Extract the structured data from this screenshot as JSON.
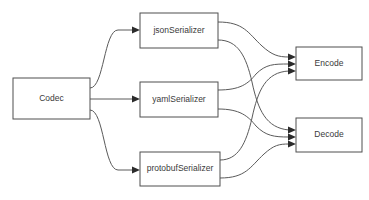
{
  "diagram": {
    "background_color": "#ffffff",
    "node_border_color": "#4f4f4f",
    "node_fill_color": "#ffffff",
    "edge_color": "#5a5a5a",
    "arrow_color": "#2b2b2b",
    "text_color": "#3a3a3a",
    "nodes": [
      {
        "id": "codec",
        "label": "Codec",
        "x": 13,
        "y": 78,
        "w": 77,
        "h": 41
      },
      {
        "id": "json",
        "label": "jsonSerializer",
        "x": 140,
        "y": 13,
        "w": 78,
        "h": 35
      },
      {
        "id": "yaml",
        "label": "yamlSerializer",
        "x": 140,
        "y": 82,
        "w": 78,
        "h": 35
      },
      {
        "id": "protobuf",
        "label": "protobufSerializer",
        "x": 140,
        "y": 152,
        "w": 80,
        "h": 34
      },
      {
        "id": "encode",
        "label": "Encode",
        "x": 296,
        "y": 47,
        "w": 66,
        "h": 33
      },
      {
        "id": "decode",
        "label": "Decode",
        "x": 296,
        "y": 118,
        "w": 66,
        "h": 34
      }
    ],
    "edges": [
      {
        "from": "codec",
        "to": "json",
        "label": ""
      },
      {
        "from": "codec",
        "to": "yaml",
        "label": ""
      },
      {
        "from": "codec",
        "to": "protobuf",
        "label": ""
      },
      {
        "from": "json",
        "to": "encode",
        "label": ""
      },
      {
        "from": "json",
        "to": "decode",
        "label": ""
      },
      {
        "from": "yaml",
        "to": "encode",
        "label": ""
      },
      {
        "from": "yaml",
        "to": "decode",
        "label": ""
      },
      {
        "from": "protobuf",
        "to": "encode",
        "label": ""
      },
      {
        "from": "protobuf",
        "to": "decode",
        "label": ""
      }
    ]
  }
}
